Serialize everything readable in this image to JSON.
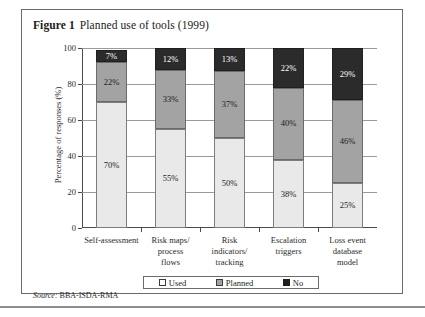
{
  "figure": {
    "label": "Figure 1",
    "caption": "Planned use of tools (1999)",
    "source_prefix": "Source:",
    "source_value": "BBA-ISDA-RMA"
  },
  "chart_data": {
    "type": "bar",
    "subtype": "stacked-100-percent",
    "title": "Planned use of tools (1999)",
    "xlabel": "",
    "ylabel": "Percentage of responses (%)",
    "ylim": [
      0,
      100
    ],
    "yticks": [
      0,
      20,
      40,
      60,
      80,
      100
    ],
    "ytick_labels": [
      "0",
      "20",
      "40",
      "60",
      "80",
      "100"
    ],
    "grid": true,
    "legend_position": "bottom",
    "categories": [
      "Self-assessment",
      "Risk maps/ process flows",
      "Risk indicators/ tracking",
      "Escalation triggers",
      "Loss event database model"
    ],
    "category_lines": [
      [
        "Self-assessment"
      ],
      [
        "Risk maps/",
        "process",
        "flows"
      ],
      [
        "Risk",
        "indicators/",
        "tracking"
      ],
      [
        "Escalation",
        "triggers"
      ],
      [
        "Loss event",
        "database",
        "model"
      ]
    ],
    "series": [
      {
        "name": "Used",
        "color": "#e9e9e9",
        "values": [
          70,
          55,
          50,
          38,
          25
        ],
        "labels": [
          "70%",
          "55%",
          "50%",
          "38%",
          "25%"
        ]
      },
      {
        "name": "Planned",
        "color": "#a3a3a3",
        "values": [
          22,
          33,
          37,
          40,
          46
        ],
        "labels": [
          "22%",
          "33%",
          "37%",
          "40%",
          "46%"
        ]
      },
      {
        "name": "No",
        "color": "#2b2b2b",
        "values": [
          7,
          12,
          13,
          22,
          29
        ],
        "labels": [
          "7%",
          "12%",
          "13%",
          "22%",
          "29%"
        ]
      }
    ],
    "legend_entries": [
      {
        "label": "Used",
        "swatch": "light"
      },
      {
        "label": "Planned",
        "swatch": "medium"
      },
      {
        "label": "No",
        "swatch": "dark"
      }
    ]
  }
}
